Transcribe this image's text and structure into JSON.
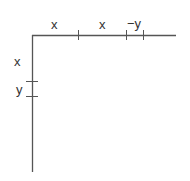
{
  "diagram": {
    "type": "axes-segment-diagram",
    "horizontal_axis": {
      "segment_labels": [
        "x",
        "x",
        "−y"
      ]
    },
    "vertical_axis": {
      "segment_labels": [
        "x",
        "y"
      ]
    },
    "colors": {
      "line": "#555555",
      "text": "#333333"
    }
  }
}
